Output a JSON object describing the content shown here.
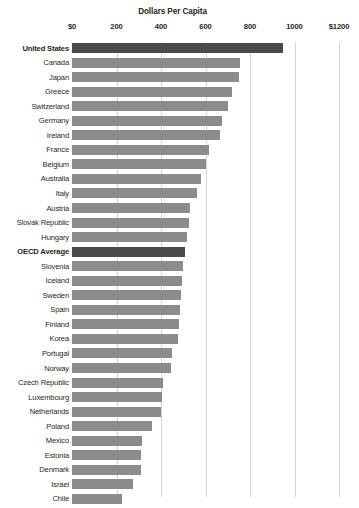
{
  "chart_data": {
    "type": "bar",
    "orientation": "horizontal",
    "title": "Dollars Per Capita",
    "xlabel": "",
    "ylabel": "",
    "xlim": [
      0,
      1200
    ],
    "xticks": [
      0,
      200,
      400,
      600,
      800,
      1000,
      1200
    ],
    "xtick_labels": [
      "$0",
      "200",
      "400",
      "600",
      "800",
      "1000",
      "$1200"
    ],
    "grid": true,
    "legend": null,
    "bar_color": "#8c8c8c",
    "highlight_color": "#4a4a4a",
    "highlighted": [
      "United States",
      "OECD Average"
    ],
    "categories": [
      "United States",
      "Canada",
      "Japan",
      "Greece",
      "Switzerland",
      "Germany",
      "Ireland",
      "France",
      "Belgium",
      "Australia",
      "Italy",
      "Austria",
      "Slovak Republic",
      "Hungary",
      "OECD Average",
      "Slovenia",
      "Iceland",
      "Sweden",
      "Spain",
      "Finland",
      "Korea",
      "Portugal",
      "Norway",
      "Czech Republic",
      "Luxembourg",
      "Netherlands",
      "Poland",
      "Mexico",
      "Estonia",
      "Denmark",
      "Israel",
      "Chile"
    ],
    "values": [
      950,
      755,
      750,
      720,
      700,
      675,
      665,
      615,
      600,
      580,
      560,
      532,
      525,
      515,
      510,
      500,
      495,
      490,
      487,
      482,
      478,
      450,
      445,
      410,
      405,
      400,
      360,
      316,
      312,
      308,
      275,
      225
    ]
  }
}
